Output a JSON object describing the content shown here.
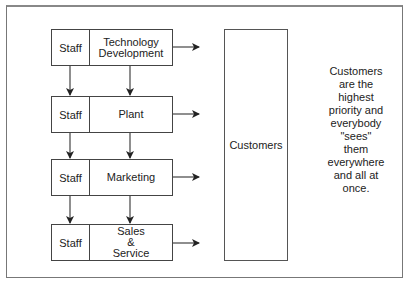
{
  "diagram": {
    "rows": [
      {
        "staff": "Staff",
        "function": "Technology\nDevelopment"
      },
      {
        "staff": "Staff",
        "function": "Plant"
      },
      {
        "staff": "Staff",
        "function": "Marketing"
      },
      {
        "staff": "Staff",
        "function": "Sales\n&\nService"
      }
    ],
    "customers_label": "Customers",
    "note": "Customers\nare the\nhighest\npriority and\neverybody\n\"sees\"\nthem\neverywhere\nand all at\nonce."
  }
}
